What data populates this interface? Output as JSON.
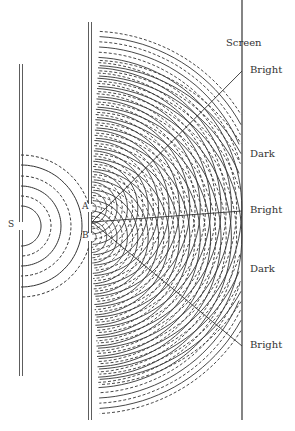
{
  "diagram": {
    "source_slit_label": "S",
    "slit_a_label": "A",
    "slit_b_label": "B",
    "screen_label": "Screen",
    "fringes": [
      {
        "label": "Bright",
        "y": 71
      },
      {
        "label": "Dark",
        "y": 155
      },
      {
        "label": "Bright",
        "y": 211
      },
      {
        "label": "Dark",
        "y": 270
      },
      {
        "label": "Bright",
        "y": 346
      }
    ],
    "colors": {
      "line": "#333333",
      "background": "#ffffff"
    }
  }
}
